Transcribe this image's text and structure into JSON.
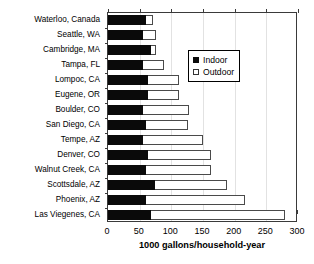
{
  "chart_data": {
    "type": "bar",
    "orientation": "horizontal",
    "stacked": true,
    "title": "",
    "xlabel": "1000 gallons/household-year",
    "ylabel": "",
    "xlim": [
      0,
      300
    ],
    "xticks": [
      0,
      50,
      100,
      150,
      200,
      250,
      300
    ],
    "grid": "vertical",
    "legend": {
      "position": "upper-center-right",
      "entries": [
        {
          "label": "Indoor",
          "swatch": "filled-black-square"
        },
        {
          "label": "Outdoor",
          "swatch": "open-white-square"
        }
      ]
    },
    "categories": [
      "Waterloo, Canada",
      "Seattle, WA",
      "Cambridge, MA",
      "Tampa, FL",
      "Lompoc, CA",
      "Eugene, OR",
      "Boulder, CO",
      "San Diego, CA",
      "Tempe, AZ",
      "Denver, CO",
      "Walnut Creek, CA",
      "Scottsdale, AZ",
      "Phoenix, AZ",
      "Las Viegenes, CA"
    ],
    "series": [
      {
        "name": "Indoor",
        "values": [
          60,
          55,
          68,
          55,
          63,
          63,
          55,
          60,
          55,
          63,
          60,
          74,
          60,
          68
        ]
      },
      {
        "name": "Outdoor",
        "values": [
          11,
          21,
          8,
          33,
          49,
          49,
          73,
          66,
          95,
          100,
          103,
          114,
          156,
          212
        ]
      }
    ],
    "totals": [
      71,
      76,
      76,
      88,
      112,
      112,
      128,
      126,
      150,
      163,
      163,
      188,
      216,
      280
    ]
  }
}
